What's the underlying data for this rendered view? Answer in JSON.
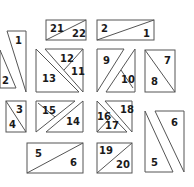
{
  "colors": {
    "stroke": "#555555",
    "text": "#1a1a1a",
    "background": "#ffffff"
  },
  "pieces": [
    {
      "id": "group-1-2",
      "labels": [
        "1",
        "2"
      ]
    },
    {
      "id": "group-21-22",
      "labels": [
        "21",
        "22"
      ]
    },
    {
      "id": "group-2-1",
      "labels": [
        "2",
        "1"
      ]
    },
    {
      "id": "group-11-12-13",
      "labels": [
        "12",
        "11",
        "13"
      ]
    },
    {
      "id": "group-9-10",
      "labels": [
        "9",
        "10"
      ]
    },
    {
      "id": "group-7-8",
      "labels": [
        "7",
        "8"
      ]
    },
    {
      "id": "group-3-4",
      "labels": [
        "3",
        "4"
      ]
    },
    {
      "id": "group-14-15",
      "labels": [
        "15",
        "14"
      ]
    },
    {
      "id": "group-16-17-18",
      "labels": [
        "16",
        "17",
        "18"
      ]
    },
    {
      "id": "group-5-6-small",
      "labels": [
        "5",
        "6"
      ]
    },
    {
      "id": "group-19-20",
      "labels": [
        "19",
        "20"
      ]
    },
    {
      "id": "group-5-6-tall",
      "labels": [
        "6",
        "5"
      ]
    }
  ]
}
